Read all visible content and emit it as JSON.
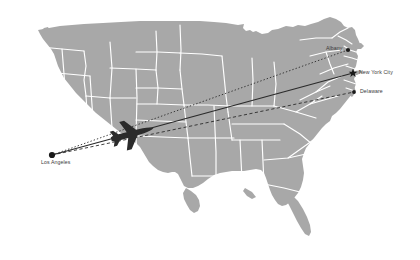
{
  "figure": {
    "type": "flight-route-map",
    "region": "United States",
    "background_color": "#ffffff",
    "land_color": "#a8a8a8",
    "border_color": "#ffffff",
    "route_color": "#2b2b2b",
    "marker_color": "#1a1a1a",
    "label_color": "#3a3a3a"
  },
  "cities": [
    {
      "id": "los-angeles",
      "label": "Los Angeles",
      "marker": "circle",
      "role": "origin",
      "x": 52,
      "y": 155
    },
    {
      "id": "albany",
      "label": "Albany",
      "marker": "circle",
      "role": "destination",
      "x": 348,
      "y": 50
    },
    {
      "id": "new-york-city",
      "label": "New York City",
      "marker": "star",
      "role": "destination",
      "x": 353,
      "y": 73
    },
    {
      "id": "delaware",
      "label": "Delaware",
      "marker": "circle",
      "role": "destination",
      "x": 354,
      "y": 92
    }
  ],
  "routes": [
    {
      "id": "route-la-albany",
      "from": "Los Angeles",
      "to": "Albany",
      "style": "dotted"
    },
    {
      "id": "route-la-new-york-city",
      "from": "Los Angeles",
      "to": "New York City",
      "style": "solid"
    },
    {
      "id": "route-la-delaware",
      "from": "Los Angeles",
      "to": "Delaware",
      "style": "dashed"
    }
  ],
  "aircraft": {
    "id": "airplane",
    "on_route": "route-la-new-york-city",
    "x": 135,
    "y": 133,
    "heading": "northeast"
  }
}
